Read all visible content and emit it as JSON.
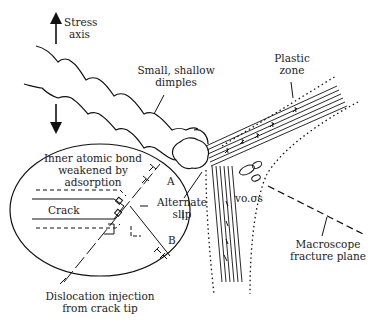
{
  "diagram": {
    "type": "fracture mechanism schematic",
    "labels": {
      "stress_axis_line1": "Stress",
      "stress_axis_line2": "axis",
      "dimples_line1": "Small, shallow",
      "dimples_line2": "dimples",
      "plastic_zone_line1": "Plastic",
      "plastic_zone_line2": "zone",
      "inner_bond_line1": "Inner atomic bond",
      "inner_bond_line2": "weakened by",
      "inner_bond_line3": "adsorption",
      "crack": "Crack",
      "point_a": "A",
      "point_b": "B",
      "alternate_slip_line1": "Alternate",
      "alternate_slip_line2": "slip",
      "voids": "vo.σs",
      "macroscope_line1": "Macroscope",
      "macroscope_line2": "fracture plane",
      "dislocation_line1": "Dislocation injection",
      "dislocation_line2": "from crack tip"
    },
    "colors": {
      "stroke": "#1a1a1a",
      "background": "#ffffff"
    }
  }
}
